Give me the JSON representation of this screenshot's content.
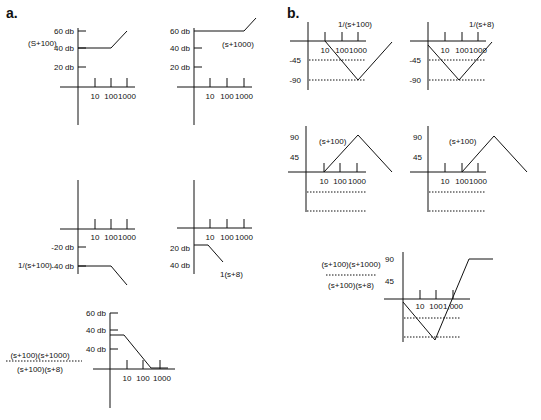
{
  "figure": {
    "sections": [
      {
        "id": "a",
        "label": "a.",
        "x": 6,
        "y": 18
      },
      {
        "id": "b",
        "label": "b.",
        "x": 287,
        "y": 18
      }
    ],
    "panels": [
      {
        "id": "a1",
        "title": "Magnitude plot of (S+100)",
        "axes": {
          "vx": 78,
          "vy1": 28,
          "vy2": 125,
          "hy": 87,
          "hx1": 60,
          "hx2": 135
        },
        "ticks_x": [
          95,
          111,
          127
        ],
        "tick_top": 78,
        "tick_labels": [
          {
            "t": "10",
            "x": 95,
            "y": 99
          },
          {
            "t": "100",
            "x": 111,
            "y": 99
          },
          {
            "t": "1000",
            "x": 127,
            "y": 99
          }
        ],
        "y_labels": [
          {
            "t": "60 db",
            "x": 75,
            "y": 34,
            "tick": true
          },
          {
            "t": "40 db",
            "x": 75,
            "y": 51,
            "tick": true
          },
          {
            "t": "20 db",
            "x": 75,
            "y": 70,
            "tick": true
          }
        ],
        "y_tick_len": 8,
        "notes": [
          {
            "t": "(S+100)",
            "x": 28,
            "y": 46
          }
        ],
        "curve": [
          [
            78,
            48
          ],
          [
            111,
            48
          ],
          [
            127,
            31
          ]
        ],
        "dotted": []
      },
      {
        "id": "a2",
        "title": "Magnitude plot of (s+1000)",
        "axes": {
          "vx": 194,
          "vy1": 28,
          "vy2": 125,
          "hy": 87,
          "hx1": 177,
          "hx2": 252
        },
        "ticks_x": [
          210,
          227,
          244
        ],
        "tick_top": 78,
        "tick_labels": [
          {
            "t": "10",
            "x": 210,
            "y": 99
          },
          {
            "t": "100",
            "x": 227,
            "y": 99
          },
          {
            "t": "1000",
            "x": 244,
            "y": 99
          }
        ],
        "y_labels": [
          {
            "t": "60 db",
            "x": 191,
            "y": 34,
            "tick": false
          },
          {
            "t": "40 db",
            "x": 191,
            "y": 51,
            "tick": true
          },
          {
            "t": "20 db",
            "x": 191,
            "y": 70,
            "tick": true
          }
        ],
        "y_tick_len": 8,
        "notes": [
          {
            "t": "(s+1000)",
            "x": 222,
            "y": 47
          }
        ],
        "curve": [
          [
            194,
            31
          ],
          [
            244,
            31
          ],
          [
            256,
            18
          ]
        ],
        "dotted": []
      },
      {
        "id": "a3",
        "title": "Magnitude plot of 1/(s+100)",
        "axes": {
          "vx": 78,
          "vy1": 180,
          "vy2": 274,
          "hy": 229,
          "hx1": 60,
          "hx2": 135
        },
        "ticks_x": [
          95,
          111,
          127
        ],
        "tick_top": 219,
        "tick_labels": [
          {
            "t": "10",
            "x": 95,
            "y": 240
          },
          {
            "t": "100",
            "x": 111,
            "y": 240
          },
          {
            "t": "1000",
            "x": 127,
            "y": 240
          }
        ],
        "y_labels": [
          {
            "t": "-20 db",
            "x": 75,
            "y": 250,
            "tick": true
          },
          {
            "t": "-40 db",
            "x": 75,
            "y": 269,
            "tick": true
          }
        ],
        "y_tick_len": 8,
        "notes": [
          {
            "t": "1/(s+100)",
            "x": 18,
            "y": 268
          }
        ],
        "curve": [
          [
            78,
            266
          ],
          [
            111,
            266
          ],
          [
            127,
            285
          ]
        ],
        "dotted": []
      },
      {
        "id": "a4",
        "title": "Magnitude plot of 1/(s+8)",
        "axes": {
          "vx": 194,
          "vy1": 180,
          "vy2": 274,
          "hy": 228,
          "hx1": 177,
          "hx2": 252
        },
        "ticks_x": [
          210,
          227,
          244
        ],
        "tick_top": 219,
        "tick_labels": [
          {
            "t": "10",
            "x": 210,
            "y": 240
          },
          {
            "t": "100",
            "x": 227,
            "y": 240
          },
          {
            "t": "1000",
            "x": 244,
            "y": 240
          }
        ],
        "y_labels": [
          {
            "t": "20 db",
            "x": 191,
            "y": 251,
            "tick": false
          },
          {
            "t": "40 db",
            "x": 191,
            "y": 268,
            "tick": false
          }
        ],
        "y_tick_len": 8,
        "notes": [
          {
            "t": "1(s+8)",
            "x": 220,
            "y": 277
          }
        ],
        "curve": [
          [
            194,
            245
          ],
          [
            208,
            245
          ],
          [
            223,
            262
          ]
        ],
        "dotted": []
      },
      {
        "id": "a5",
        "title": "Magnitude plot of combined transfer function",
        "axes": {
          "vx": 110,
          "vy1": 313,
          "vy2": 408,
          "hy": 369,
          "hx1": 93,
          "hx2": 175
        },
        "ticks_x": [
          127,
          143,
          160
        ],
        "tick_top": 360,
        "tick_labels": [
          {
            "t": "10",
            "x": 127,
            "y": 381
          },
          {
            "t": "100",
            "x": 143,
            "y": 381
          },
          {
            "t": "1000",
            "x": 162,
            "y": 381
          }
        ],
        "y_labels": [
          {
            "t": "60 db",
            "x": 107,
            "y": 316,
            "tick": true
          },
          {
            "t": "40 db",
            "x": 107,
            "y": 333,
            "tick": true
          },
          {
            "t": "40 db",
            "x": 107,
            "y": 352,
            "tick": true
          }
        ],
        "y_tick_len": 8,
        "notes": [],
        "curve": [
          [
            110,
            335
          ],
          [
            124,
            335
          ],
          [
            151,
            368
          ],
          [
            168,
            368
          ]
        ],
        "dotted": []
      },
      {
        "id": "b1",
        "title": "Phase plot of 1/(s+100)",
        "axes": {
          "vx": 308,
          "vy1": 22,
          "vy2": 90,
          "hy": 41,
          "hx1": 290,
          "hx2": 366
        },
        "ticks_x": [
          325,
          342,
          358
        ],
        "tick_top": 32,
        "tick_labels": [
          {
            "t": "10",
            "x": 325,
            "y": 53
          },
          {
            "t": "100",
            "x": 342,
            "y": 53
          },
          {
            "t": "1000",
            "x": 358,
            "y": 53
          }
        ],
        "y_labels": [
          {
            "t": "-45",
            "x": 302,
            "y": 63,
            "tick": false
          },
          {
            "t": "-90",
            "x": 302,
            "y": 83,
            "tick": false
          }
        ],
        "y_tick_len": 0,
        "notes": [
          {
            "t": "1/(s+100)",
            "x": 338,
            "y": 27
          }
        ],
        "curve": [
          [
            325,
            41
          ],
          [
            358,
            80
          ],
          [
            392,
            42
          ]
        ],
        "dotted": [
          [
            [
              309,
              60
            ],
            [
              366,
              60
            ]
          ],
          [
            [
              309,
              80
            ],
            [
              366,
              80
            ]
          ]
        ]
      },
      {
        "id": "b2",
        "title": "Phase plot of 1/(s+8)",
        "axes": {
          "vx": 428,
          "vy1": 22,
          "vy2": 90,
          "hy": 41,
          "hx1": 410,
          "hx2": 486
        },
        "ticks_x": [
          445,
          462,
          478
        ],
        "tick_top": 32,
        "tick_labels": [
          {
            "t": "10",
            "x": 445,
            "y": 53
          },
          {
            "t": "100",
            "x": 462,
            "y": 53
          },
          {
            "t": "1000",
            "x": 478,
            "y": 53
          }
        ],
        "y_labels": [
          {
            "t": "-45",
            "x": 422,
            "y": 63,
            "tick": false
          },
          {
            "t": "-90",
            "x": 422,
            "y": 83,
            "tick": false
          }
        ],
        "y_tick_len": 0,
        "notes": [
          {
            "t": "1/(s+8)",
            "x": 469,
            "y": 27
          }
        ],
        "curve": [
          [
            428,
            45
          ],
          [
            459,
            80
          ],
          [
            492,
            42
          ]
        ],
        "dotted": [
          [
            [
              429,
              60
            ],
            [
              486,
              60
            ]
          ],
          [
            [
              429,
              80
            ],
            [
              486,
              80
            ]
          ]
        ]
      },
      {
        "id": "b3",
        "title": "Phase plot of (s+100)",
        "axes": {
          "vx": 306,
          "vy1": 126,
          "vy2": 212,
          "hy": 172,
          "hx1": 288,
          "hx2": 366
        },
        "ticks_x": [
          324,
          340,
          357
        ],
        "tick_top": 163,
        "tick_labels": [
          {
            "t": "10",
            "x": 324,
            "y": 184
          },
          {
            "t": "100",
            "x": 340,
            "y": 184
          },
          {
            "t": "1000",
            "x": 357,
            "y": 184
          }
        ],
        "y_labels": [
          {
            "t": "90",
            "x": 300,
            "y": 140,
            "tick": false
          },
          {
            "t": "45",
            "x": 300,
            "y": 160,
            "tick": false
          }
        ],
        "y_tick_len": 0,
        "notes": [
          {
            "t": "(s+100)",
            "x": 319,
            "y": 144
          }
        ],
        "curve": [
          [
            324,
            172
          ],
          [
            358,
            135
          ],
          [
            392,
            172
          ]
        ],
        "dotted": [
          [
            [
              307,
              192
            ],
            [
              366,
              192
            ]
          ],
          [
            [
              307,
              211
            ],
            [
              366,
              211
            ]
          ]
        ]
      },
      {
        "id": "b4",
        "title": "Phase plot of (s+100) shifted",
        "axes": {
          "vx": 428,
          "vy1": 126,
          "vy2": 212,
          "hy": 172,
          "hx1": 410,
          "hx2": 486
        },
        "ticks_x": [
          445,
          462,
          478
        ],
        "tick_top": 163,
        "tick_labels": [
          {
            "t": "10",
            "x": 445,
            "y": 184
          },
          {
            "t": "100",
            "x": 462,
            "y": 184
          },
          {
            "t": "1000",
            "x": 478,
            "y": 184
          }
        ],
        "y_labels": [
          {
            "t": "90",
            "x": 423,
            "y": 140,
            "tick": false
          },
          {
            "t": "45",
            "x": 423,
            "y": 160,
            "tick": false
          }
        ],
        "y_tick_len": 0,
        "notes": [
          {
            "t": "(s+100)",
            "x": 449,
            "y": 144
          }
        ],
        "curve": [
          [
            462,
            172
          ],
          [
            494,
            136
          ],
          [
            527,
            172
          ]
        ],
        "dotted": [
          [
            [
              429,
              192
            ],
            [
              486,
              192
            ]
          ],
          [
            [
              429,
              211
            ],
            [
              486,
              211
            ]
          ]
        ]
      },
      {
        "id": "b5",
        "title": "Phase plot of combined transfer function",
        "axes": {
          "vx": 403,
          "vy1": 252,
          "vy2": 342,
          "hy": 299,
          "hx1": 384,
          "hx2": 470
        },
        "ticks_x": [
          420,
          436,
          453
        ],
        "tick_top": 290,
        "tick_labels": [
          {
            "t": "10",
            "x": 420,
            "y": 309
          },
          {
            "t": "100",
            "x": 436,
            "y": 309
          },
          {
            "t": "1,000",
            "x": 453,
            "y": 309
          }
        ],
        "y_labels": [
          {
            "t": "90",
            "x": 395,
            "y": 262,
            "tick": false
          },
          {
            "t": "45",
            "x": 395,
            "y": 284,
            "tick": false
          }
        ],
        "y_tick_len": 0,
        "notes": [],
        "curve": [
          [
            403,
            302
          ],
          [
            435,
            340
          ],
          [
            469,
            259
          ],
          [
            493,
            259
          ]
        ],
        "dotted": [
          [
            [
              404,
              318
            ],
            [
              461,
              318
            ]
          ],
          [
            [
              404,
              337
            ],
            [
              461,
              337
            ]
          ]
        ]
      }
    ],
    "fractions": [
      {
        "id": "frac-a",
        "numerator": "(s+100)(s+1000)",
        "denominator": "(s+100)(s+8)",
        "cx": 40,
        "ny": 358,
        "dy": 372,
        "lx1": 6,
        "lx2": 82,
        "ly": 361
      },
      {
        "id": "frac-b",
        "numerator": "(s+100)(s+1000)",
        "denominator": "(s+100)(s+8)",
        "cx": 351,
        "ny": 267,
        "dy": 288,
        "lx1": 326,
        "lx2": 377,
        "ly": 275
      }
    ]
  }
}
